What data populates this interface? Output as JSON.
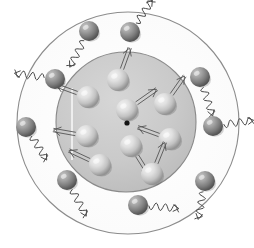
{
  "figure": {
    "caption": "",
    "background_color": "#ffffff",
    "canvas": {
      "width": 254,
      "height": 248
    }
  },
  "colors": {
    "background": "#ffffff",
    "outer_ring_fill": "#fdfdfd",
    "outer_ring_stroke": "#8c8c8c",
    "core_fill": "#c9c9c9",
    "core_fill_edge": "#b8b8b8",
    "core_stroke": "#8a8a8a",
    "inner_sphere_light": "#e8e8e8",
    "inner_sphere_mid": "#cccccc",
    "inner_sphere_dark": "#9a9a9a",
    "outer_sphere_light": "#bdbdbd",
    "outer_sphere_mid": "#8f8f8f",
    "outer_sphere_dark": "#5e5e5e",
    "arrow_stroke": "#555555",
    "wave_stroke": "#4a4a4a",
    "center_dot": "#111111",
    "white_line": "#f7f7f7"
  },
  "chart_data": {
    "type": "scatter",
    "xlabel": "",
    "ylabel": "",
    "xlim": [
      0,
      254
    ],
    "ylim": [
      0,
      248
    ],
    "grid": false,
    "legend": "none",
    "annotations": [
      {
        "name": "outer-boundary-circle",
        "shape": "circle",
        "cx": 128,
        "cy": 123,
        "r": 111,
        "fill": "#fdfdfd",
        "stroke": "#8c8c8c"
      },
      {
        "name": "core-circle",
        "shape": "circle",
        "cx": 126,
        "cy": 122,
        "r": 70,
        "fill": "#c9c9c9",
        "stroke": "#8a8a8a"
      },
      {
        "name": "nucleus-center-dot",
        "shape": "dot",
        "cx": 127,
        "cy": 123,
        "r": 2.6,
        "fill": "#111111"
      },
      {
        "name": "core-vertical-highlight-line",
        "shape": "line",
        "x1": 72,
        "y1": 88,
        "x2": 72,
        "y2": 160,
        "stroke": "#f7f7f7"
      }
    ],
    "series": [
      {
        "name": "core-particles",
        "marker": "sphere",
        "fill": "#dcdcdc",
        "radius": 11,
        "points": [
          {
            "id": "core-particle-1",
            "x": 118,
            "y": 80,
            "arrow_angle_deg": -70,
            "arrow_length": 22
          },
          {
            "id": "core-particle-2",
            "x": 88,
            "y": 97,
            "arrow_angle_deg": 200,
            "arrow_length": 22
          },
          {
            "id": "core-particle-3",
            "x": 127,
            "y": 110,
            "arrow_angle_deg": -35,
            "arrow_length": 24
          },
          {
            "id": "core-particle-4",
            "x": 165,
            "y": 104,
            "arrow_angle_deg": -55,
            "arrow_length": 22
          },
          {
            "id": "core-particle-5",
            "x": 87,
            "y": 136,
            "arrow_angle_deg": 190,
            "arrow_length": 22
          },
          {
            "id": "core-particle-6",
            "x": 131,
            "y": 146,
            "arrow_angle_deg": 58,
            "arrow_length": 22
          },
          {
            "id": "core-particle-7",
            "x": 170,
            "y": 139,
            "arrow_angle_deg": 200,
            "arrow_length": 22
          },
          {
            "id": "core-particle-8",
            "x": 100,
            "y": 165,
            "arrow_angle_deg": 205,
            "arrow_length": 22
          },
          {
            "id": "core-particle-9",
            "x": 152,
            "y": 174,
            "arrow_angle_deg": -68,
            "arrow_length": 22
          }
        ]
      },
      {
        "name": "shell-particles",
        "marker": "sphere",
        "fill": "#8f8f8f",
        "radius": 10,
        "points": [
          {
            "id": "shell-particle-1",
            "x": 89,
            "y": 31,
            "wave_angle_deg": 118,
            "wave_length": 30
          },
          {
            "id": "shell-particle-2",
            "x": 130,
            "y": 32,
            "wave_angle_deg": -55,
            "wave_length": 28
          },
          {
            "id": "shell-particle-3",
            "x": 55,
            "y": 79,
            "wave_angle_deg": 188,
            "wave_length": 30
          },
          {
            "id": "shell-particle-4",
            "x": 200,
            "y": 77,
            "wave_angle_deg": 72,
            "wave_length": 30
          },
          {
            "id": "shell-particle-5",
            "x": 26,
            "y": 127,
            "wave_angle_deg": 58,
            "wave_length": 28
          },
          {
            "id": "shell-particle-6",
            "x": 213,
            "y": 126,
            "wave_angle_deg": -8,
            "wave_length": 30
          },
          {
            "id": "shell-particle-7",
            "x": 67,
            "y": 180,
            "wave_angle_deg": 62,
            "wave_length": 30
          },
          {
            "id": "shell-particle-8",
            "x": 205,
            "y": 181,
            "wave_angle_deg": 100,
            "wave_length": 28
          },
          {
            "id": "shell-particle-9",
            "x": 138,
            "y": 205,
            "wave_angle_deg": 5,
            "wave_length": 30
          }
        ]
      }
    ]
  }
}
